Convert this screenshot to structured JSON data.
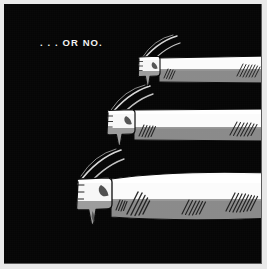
{
  "panel": {
    "caption": ". . . OR NO.",
    "background_color": "#050505",
    "frame_color": "#e9e9e9",
    "frame_shadow_color": "#5c5c5c",
    "width": 267,
    "height": 269
  },
  "palette": {
    "ink_black": "#050505",
    "sleeve_white": "#fbfbfb",
    "sleeve_highlight": "#ffffff",
    "sleeve_shadow_gray": "#8a8a8a",
    "sleeve_shadow_gray_dark": "#787878",
    "hand_white": "#f7f7f7",
    "hatch_ink": "#1a1a1a",
    "speed_line": "#e4e4e4",
    "caption_text": "#f2f2f2"
  },
  "subjects": [
    {
      "id": "thumbs-down-top",
      "label": "thumbs-down arm, top / smallest",
      "description": "A fist with thumb pointing down at the end of a sleeved forearm extending to the right edge of the panel.",
      "gesture": "thumbs-down",
      "size_rank": 3,
      "arm": {
        "x": 150,
        "y": 50,
        "width": 113,
        "height": 29,
        "white_band_ratio": 0.52,
        "hatch_clusters": [
          {
            "x": 9,
            "y": 15,
            "lines": 4,
            "length": 10,
            "angle": -62
          },
          {
            "x": 82,
            "y": 11,
            "lines": 7,
            "length": 13,
            "angle": -60
          }
        ]
      },
      "hand": {
        "x": 135,
        "y": 56,
        "width": 22,
        "height": 18,
        "thumb_length": 12
      },
      "speed_lines": {
        "x": 131,
        "y": 34,
        "count": 3,
        "arc": "upper-left sweep"
      }
    },
    {
      "id": "thumbs-down-middle",
      "label": "thumbs-down arm, middle",
      "description": "A fist with thumb pointing down at the end of a sleeved forearm extending to the right edge of the panel.",
      "gesture": "thumbs-down",
      "size_rank": 2,
      "arm": {
        "x": 132,
        "y": 103,
        "width": 131,
        "height": 33,
        "white_band_ratio": 0.58,
        "hatch_clusters": [
          {
            "x": 10,
            "y": 17,
            "lines": 5,
            "length": 12,
            "angle": -64
          },
          {
            "x": 97,
            "y": 14,
            "lines": 7,
            "length": 14,
            "angle": -62
          }
        ]
      },
      "hand": {
        "x": 104,
        "y": 108,
        "width": 28,
        "height": 23,
        "thumb_length": 16
      },
      "speed_lines": {
        "x": 99,
        "y": 84,
        "count": 3,
        "arc": "upper-left sweep"
      }
    },
    {
      "id": "thumbs-down-bottom",
      "label": "thumbs-down arm, bottom / largest",
      "description": "A large fist with thumb pointing down at the end of a broad sleeved forearm extending to the right edge of the panel.",
      "gesture": "thumbs-down",
      "size_rank": 1,
      "arm": {
        "x": 107,
        "y": 168,
        "width": 156,
        "height": 48,
        "white_band_ratio": 0.55,
        "hatch_clusters": [
          {
            "x": 12,
            "y": 24,
            "lines": 4,
            "length": 12,
            "angle": -62
          },
          {
            "x": 26,
            "y": 17,
            "lines": 5,
            "length": 22,
            "angle": -60
          },
          {
            "x": 78,
            "y": 26,
            "lines": 6,
            "length": 14,
            "angle": -60
          },
          {
            "x": 122,
            "y": 16,
            "lines": 8,
            "length": 18,
            "angle": -58
          }
        ]
      },
      "hand": {
        "x": 73,
        "y": 178,
        "width": 36,
        "height": 32,
        "thumb_length": 22
      },
      "speed_lines": {
        "x": 69,
        "y": 148,
        "count": 3,
        "arc": "upper-left sweep"
      }
    }
  ]
}
